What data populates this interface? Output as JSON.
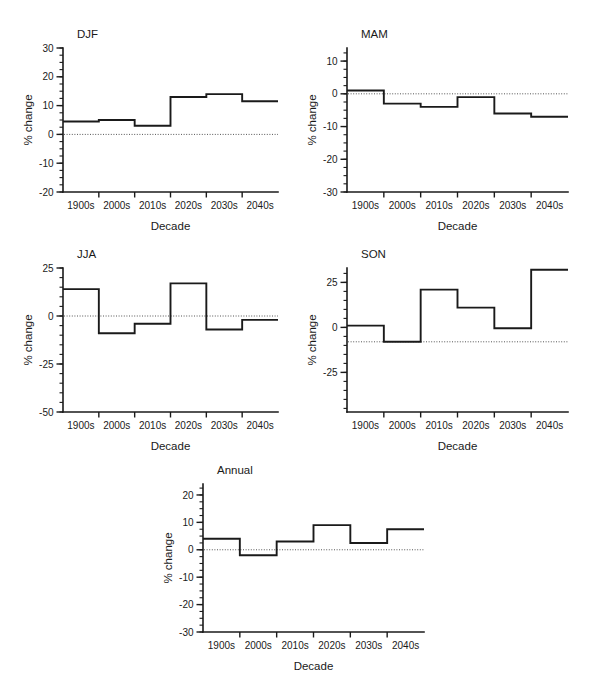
{
  "figure": {
    "categories": [
      "1900s",
      "2000s",
      "2010s",
      "2020s",
      "2030s",
      "2040s"
    ],
    "xlabel": "Decade",
    "ylabel": "% change"
  },
  "chart_data": [
    {
      "type": "line",
      "subtype": "step",
      "title": "DJF",
      "xlabel": "Decade",
      "ylabel": "% change",
      "categories": [
        "1900s",
        "2000s",
        "2010s",
        "2020s",
        "2030s",
        "2040s"
      ],
      "values": [
        4.5,
        5,
        3,
        13,
        14,
        11.5
      ],
      "ylim": [
        -20,
        30
      ],
      "yticks": [
        30,
        20,
        10,
        0,
        -10,
        -20
      ],
      "ytick_labels": [
        "30",
        "20",
        "10",
        "0",
        "-10",
        "-20"
      ],
      "minor_tick_step": 2.5,
      "reference_line": 0,
      "grid": false,
      "legend": "none"
    },
    {
      "type": "line",
      "subtype": "step",
      "title": "MAM",
      "xlabel": "Decade",
      "ylabel": "% change",
      "categories": [
        "1900s",
        "2000s",
        "2010s",
        "2020s",
        "2030s",
        "2040s"
      ],
      "values": [
        1,
        -3,
        -4,
        -1,
        -6,
        -7
      ],
      "ylim": [
        -30,
        14
      ],
      "yticks": [
        10,
        0,
        -10,
        -20,
        -30
      ],
      "ytick_labels": [
        "10",
        "0",
        "-10",
        "-20",
        "-30"
      ],
      "minor_tick_step": 2.5,
      "reference_line": 0,
      "grid": false,
      "legend": "none"
    },
    {
      "type": "line",
      "subtype": "step",
      "title": "JJA",
      "xlabel": "Decade",
      "ylabel": "% change",
      "categories": [
        "1900s",
        "2000s",
        "2010s",
        "2020s",
        "2030s",
        "2040s"
      ],
      "values": [
        14,
        -9,
        -4,
        17,
        -7,
        -2
      ],
      "ylim": [
        -50,
        25
      ],
      "yticks": [
        25,
        0,
        -25,
        -50
      ],
      "ytick_labels": [
        "25",
        "0",
        "-25",
        "-50"
      ],
      "minor_tick_step": 5,
      "reference_line": 0,
      "grid": false,
      "legend": "none"
    },
    {
      "type": "line",
      "subtype": "step",
      "title": "SON",
      "xlabel": "Decade",
      "ylabel": "% change",
      "categories": [
        "1900s",
        "2000s",
        "2010s",
        "2020s",
        "2030s",
        "2040s"
      ],
      "values": [
        1,
        -8,
        21,
        11,
        -0.5,
        32
      ],
      "ylim": [
        -47,
        33
      ],
      "yticks": [
        25,
        0,
        -25
      ],
      "ytick_labels": [
        "25",
        "0",
        "-25"
      ],
      "minor_tick_step": 5,
      "reference_line": -8,
      "grid": false,
      "legend": "none"
    },
    {
      "type": "line",
      "subtype": "step",
      "title": "Annual",
      "xlabel": "Decade",
      "ylabel": "% change",
      "categories": [
        "1900s",
        "2000s",
        "2010s",
        "2020s",
        "2030s",
        "2040s"
      ],
      "values": [
        4,
        -2,
        3,
        9,
        2.5,
        7.5
      ],
      "ylim": [
        -30,
        24
      ],
      "yticks": [
        20,
        10,
        0,
        -10,
        -20,
        -30
      ],
      "ytick_labels": [
        "20",
        "10",
        "0",
        "-10",
        "-20",
        "-30"
      ],
      "minor_tick_step": 2.5,
      "reference_line": 0,
      "grid": false,
      "legend": "none"
    }
  ],
  "panel_layout": [
    {
      "name": "djf",
      "left": 16,
      "top": 22,
      "width": 276,
      "height": 222
    },
    {
      "name": "mam",
      "left": 300,
      "top": 22,
      "width": 282,
      "height": 222
    },
    {
      "name": "jja",
      "left": 16,
      "top": 242,
      "width": 276,
      "height": 222
    },
    {
      "name": "son",
      "left": 300,
      "top": 242,
      "width": 282,
      "height": 222
    },
    {
      "name": "annual",
      "left": 156,
      "top": 458,
      "width": 282,
      "height": 226
    }
  ]
}
